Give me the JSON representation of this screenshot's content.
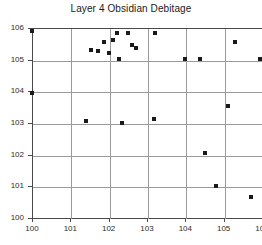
{
  "chart_data": {
    "type": "scatter",
    "title": "Layer 4 Obsidian Debitage",
    "xlabel": "",
    "ylabel": "",
    "xlim": [
      100,
      106
    ],
    "ylim": [
      100,
      106
    ],
    "xticks": [
      100,
      101,
      102,
      103,
      104,
      105,
      106
    ],
    "yticks": [
      100,
      101,
      102,
      103,
      104,
      105,
      106
    ],
    "grid": true,
    "legend": null,
    "marker": "square",
    "marker_color": "#1a1a1a",
    "points": [
      {
        "x": 100.0,
        "y": 105.9
      },
      {
        "x": 100.0,
        "y": 103.95
      },
      {
        "x": 101.4,
        "y": 103.05
      },
      {
        "x": 101.55,
        "y": 105.3
      },
      {
        "x": 101.72,
        "y": 105.26
      },
      {
        "x": 101.88,
        "y": 105.55
      },
      {
        "x": 102.02,
        "y": 105.22
      },
      {
        "x": 102.12,
        "y": 105.62
      },
      {
        "x": 102.22,
        "y": 105.85
      },
      {
        "x": 102.27,
        "y": 105.03
      },
      {
        "x": 102.36,
        "y": 103.0
      },
      {
        "x": 102.5,
        "y": 105.85
      },
      {
        "x": 102.62,
        "y": 105.45
      },
      {
        "x": 102.7,
        "y": 105.38
      },
      {
        "x": 103.18,
        "y": 103.12
      },
      {
        "x": 103.22,
        "y": 105.83
      },
      {
        "x": 104.0,
        "y": 105.02
      },
      {
        "x": 104.38,
        "y": 105.02
      },
      {
        "x": 104.52,
        "y": 102.05
      },
      {
        "x": 104.8,
        "y": 101.0
      },
      {
        "x": 105.12,
        "y": 103.55
      },
      {
        "x": 105.3,
        "y": 105.55
      },
      {
        "x": 105.7,
        "y": 100.65
      },
      {
        "x": 105.95,
        "y": 105.02
      }
    ]
  }
}
